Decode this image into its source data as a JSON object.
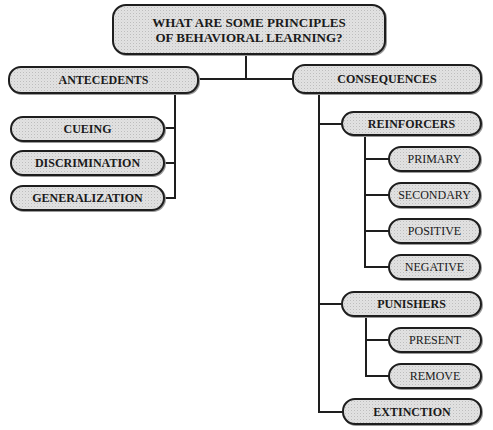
{
  "diagram": {
    "type": "tree",
    "root": {
      "line1": "WHAT ARE SOME PRINCIPLES",
      "line2": "OF BEHAVIORAL LEARNING?"
    },
    "branches": [
      {
        "label": "ANTECEDENTS",
        "children": [
          {
            "label": "CUEING"
          },
          {
            "label": "DISCRIMINATION"
          },
          {
            "label": "GENERALIZATION"
          }
        ]
      },
      {
        "label": "CONSEQUENCES",
        "children": [
          {
            "label": "REINFORCERS",
            "children": [
              {
                "label": "PRIMARY"
              },
              {
                "label": "SECONDARY"
              },
              {
                "label": "POSITIVE"
              },
              {
                "label": "NEGATIVE"
              }
            ]
          },
          {
            "label": "PUNISHERS",
            "children": [
              {
                "label": "PRESENT"
              },
              {
                "label": "REMOVE"
              }
            ]
          },
          {
            "label": "EXTINCTION"
          }
        ]
      }
    ]
  }
}
